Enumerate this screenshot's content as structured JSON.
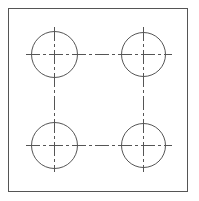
{
  "drawing": {
    "type": "technical drawing - bolt hole pattern",
    "frame": {
      "x": 8,
      "y": 8,
      "width": 179,
      "height": 183
    },
    "line_color": "#555555",
    "holes": [
      {
        "id": "top-left",
        "cx": 54,
        "cy": 54,
        "r": 23
      },
      {
        "id": "top-right",
        "cx": 143,
        "cy": 54,
        "r": 22
      },
      {
        "id": "bottom-left",
        "cx": 54,
        "cy": 145,
        "r": 23
      },
      {
        "id": "bottom-right",
        "cx": 143,
        "cy": 145,
        "r": 22
      }
    ],
    "centerlines": {
      "horizontal": [
        {
          "y": 54,
          "x1": 26,
          "x2": 172
        },
        {
          "y": 145,
          "x1": 26,
          "x2": 172
        }
      ],
      "vertical": [
        {
          "x": 54,
          "y1": 27,
          "y2": 172
        },
        {
          "x": 143,
          "y1": 27,
          "y2": 172
        }
      ]
    }
  }
}
